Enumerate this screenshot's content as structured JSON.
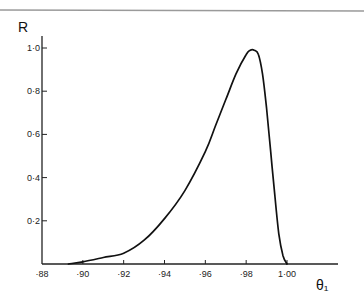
{
  "chart_data": {
    "type": "line",
    "title": "",
    "xlabel": "θ₁",
    "ylabel": "R",
    "xlim": [
      0.88,
      1.01
    ],
    "ylim": [
      0,
      1.05
    ],
    "grid": false,
    "legend": null,
    "x_ticks": [
      0.88,
      0.9,
      0.92,
      0.94,
      0.96,
      0.98,
      1.0
    ],
    "x_tick_labels": [
      "·88",
      "·90",
      "·92",
      "·94",
      "·96",
      "·98",
      "1·00"
    ],
    "y_ticks": [
      0.2,
      0.4,
      0.6,
      0.8,
      1.0
    ],
    "y_tick_labels": [
      "0·2",
      "0·4",
      "0·6",
      "0·8",
      "1·0"
    ],
    "series": [
      {
        "name": "R",
        "x": [
          0.893,
          0.9,
          0.91,
          0.92,
          0.93,
          0.94,
          0.95,
          0.96,
          0.965,
          0.97,
          0.975,
          0.98,
          0.982,
          0.984,
          0.986,
          0.988,
          0.99,
          0.992,
          0.994,
          0.996,
          0.998,
          1.0
        ],
        "y": [
          0.0,
          0.01,
          0.03,
          0.05,
          0.11,
          0.21,
          0.34,
          0.52,
          0.64,
          0.76,
          0.88,
          0.97,
          0.99,
          0.99,
          0.97,
          0.88,
          0.72,
          0.52,
          0.32,
          0.14,
          0.04,
          0.0
        ]
      }
    ]
  },
  "figure": {
    "top_rule": true
  }
}
